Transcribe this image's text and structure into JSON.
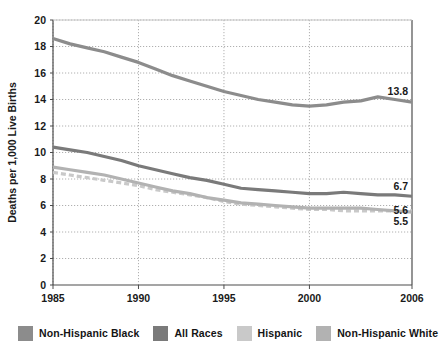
{
  "chart_data": {
    "type": "line",
    "title": "",
    "subtitle": "",
    "xlabel": "",
    "ylabel": "Deaths per 1,000 Live Births",
    "xlim": [
      1985,
      2006
    ],
    "ylim": [
      0,
      20
    ],
    "ytick_step": 2,
    "yticks": [
      "0",
      "2",
      "4",
      "6",
      "8",
      "10",
      "12",
      "14",
      "16",
      "18",
      "20"
    ],
    "xticks": [
      "1985",
      "1990",
      "1995",
      "2000",
      "2006"
    ],
    "xtick_values": [
      1985,
      1990,
      1995,
      2000,
      2006
    ],
    "grid": "dotted-both",
    "legend_position": "below",
    "x": [
      1985,
      1986,
      1987,
      1988,
      1989,
      1990,
      1991,
      1992,
      1993,
      1994,
      1995,
      1996,
      1997,
      1998,
      1999,
      2000,
      2001,
      2002,
      2003,
      2004,
      2005,
      2006
    ],
    "series": [
      {
        "name": "Non-Hispanic Black",
        "color": "#8c8c8c",
        "style": "solid",
        "values": [
          18.6,
          18.2,
          17.9,
          17.6,
          17.2,
          16.8,
          16.3,
          15.8,
          15.4,
          15.0,
          14.6,
          14.3,
          14.0,
          13.8,
          13.6,
          13.5,
          13.6,
          13.8,
          13.9,
          14.2,
          14.0,
          13.8
        ],
        "end_label": "13.8"
      },
      {
        "name": "All Races",
        "color": "#7a7a7a",
        "style": "solid",
        "values": [
          10.4,
          10.2,
          10.0,
          9.7,
          9.4,
          9.0,
          8.7,
          8.4,
          8.1,
          7.9,
          7.6,
          7.3,
          7.2,
          7.1,
          7.0,
          6.9,
          6.9,
          7.0,
          6.9,
          6.8,
          6.8,
          6.7
        ],
        "end_label": "6.7"
      },
      {
        "name": "Hispanic",
        "color": "#c9c9c9",
        "style": "dashed",
        "values": [
          8.5,
          8.3,
          8.1,
          7.9,
          7.7,
          7.5,
          7.2,
          7.0,
          6.8,
          6.6,
          6.3,
          6.1,
          6.0,
          5.9,
          5.8,
          5.7,
          5.7,
          5.6,
          5.6,
          5.6,
          5.6,
          5.6
        ],
        "end_label": "5.6"
      },
      {
        "name": "Non-Hispanic White",
        "color": "#b2b2b2",
        "style": "solid",
        "values": [
          8.9,
          8.7,
          8.5,
          8.3,
          8.0,
          7.7,
          7.4,
          7.1,
          6.9,
          6.6,
          6.4,
          6.2,
          6.1,
          6.0,
          5.9,
          5.8,
          5.8,
          5.8,
          5.8,
          5.7,
          5.6,
          5.5
        ],
        "end_label": "5.5"
      }
    ]
  },
  "axis": {
    "ylabel": "Deaths per 1,000 Live Births",
    "yticks": [
      "20",
      "18",
      "16",
      "14",
      "12",
      "10",
      "8",
      "6",
      "4",
      "2",
      "0"
    ],
    "xticks": [
      "1985",
      "1990",
      "1995",
      "2000",
      "2006"
    ]
  },
  "data_labels": [
    {
      "text": "13.8",
      "series": "Non-Hispanic Black"
    },
    {
      "text": "6.7",
      "series": "All Races"
    },
    {
      "text": "5.6",
      "series": "Hispanic"
    },
    {
      "text": "5.5",
      "series": "Non-Hispanic White"
    }
  ],
  "legend": {
    "items": [
      {
        "label": "Non-Hispanic Black",
        "color": "#8c8c8c"
      },
      {
        "label": "All Races",
        "color": "#7a7a7a"
      },
      {
        "label": "Hispanic",
        "color": "#c9c9c9"
      },
      {
        "label": "Non-Hispanic White",
        "color": "#b2b2b2"
      }
    ]
  },
  "colors": {
    "axis": "#4d4d4d",
    "grid": "#b0b0b0",
    "text": "#1a1a1a",
    "background": "#ffffff"
  }
}
